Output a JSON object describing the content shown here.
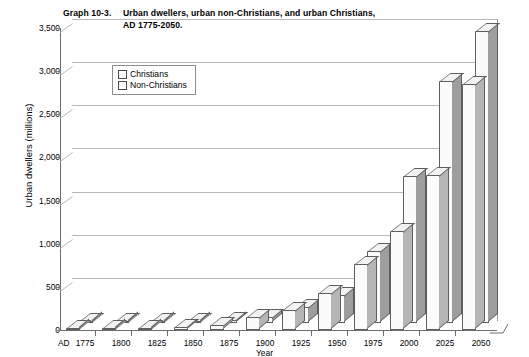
{
  "chart_data": {
    "type": "bar",
    "title_label": "Graph 10-3.",
    "title_line1": "Urban dwellers, urban non-Christians, and urban Christians,",
    "title_line2": "AD 1775-2050.",
    "xlabel": "Year",
    "ylabel": "Urban dwellers (millions)",
    "x_prefix": "AD",
    "categories": [
      "1775",
      "1800",
      "1825",
      "1850",
      "1875",
      "1900",
      "1925",
      "1950",
      "1975",
      "2000",
      "2025",
      "2050"
    ],
    "series": [
      {
        "name": "Christians",
        "values": [
          15,
          20,
          25,
          35,
          55,
          150,
          230,
          430,
          760,
          1150,
          1800,
          2850
        ]
      },
      {
        "name": "Non-Christians",
        "values": [
          10,
          12,
          15,
          22,
          35,
          75,
          180,
          330,
          830,
          1700,
          2800,
          3380
        ]
      }
    ],
    "ylim": [
      0,
      3500
    ],
    "yticks": [
      "0",
      "500",
      "1,000",
      "1,500",
      "2,000",
      "2,500",
      "3,000",
      "3,500"
    ],
    "ytick_values": [
      0,
      500,
      1000,
      1500,
      2000,
      2500,
      3000,
      3500
    ],
    "grid": true,
    "legend_position": "top-left",
    "legend": [
      "Christians",
      "Non-Christians"
    ],
    "colors": {
      "christian_face": "#fbfbfb",
      "nonchristian_face": "#fbfbfb",
      "outline": "#5e5e5e",
      "grid": "#b9b9b9",
      "axis": "#6e6e6e"
    }
  }
}
